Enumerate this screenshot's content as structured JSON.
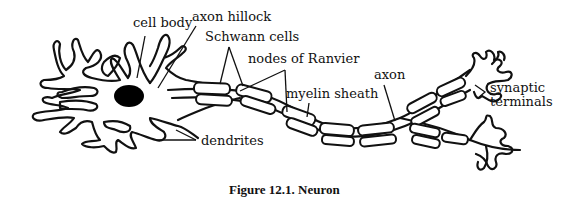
{
  "figure": {
    "caption": "Figure 12.1. Neuron",
    "subject": "neuron"
  },
  "labels": {
    "cell_body": "cell body",
    "axon_hillock": "axon hillock",
    "schwann_cells": "Schwann cells",
    "nodes_of_ranvier": "nodes of Ranvier",
    "axon": "axon",
    "myelin_sheath": "myelin sheath",
    "synaptic_line1": "synaptic",
    "synaptic_line2": "terminals",
    "dendrites": "dendrites"
  },
  "colors": {
    "ink": "#111111",
    "background": "#ffffff",
    "nucleus": "#000000"
  }
}
